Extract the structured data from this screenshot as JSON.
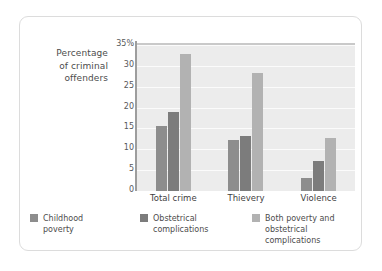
{
  "chart_data": {
    "type": "bar",
    "title": "",
    "subtitle": "",
    "xlabel": "",
    "ylabel": "Percentage of criminal offenders",
    "ylabel_lines": [
      "Percentage",
      "of criminal",
      "offenders"
    ],
    "categories": [
      "Total crime",
      "Thievery",
      "Violence"
    ],
    "series": [
      {
        "name": "Childhood poverty",
        "name_lines": [
          "Childhood",
          "poverty"
        ],
        "color": "#8d8d8d",
        "values": [
          15.5,
          12.2,
          3.2
        ]
      },
      {
        "name": "Obstetrical complications",
        "name_lines": [
          "Obstetrical",
          "complications"
        ],
        "color": "#7c7c7c",
        "values": [
          19.0,
          13.2,
          7.3
        ]
      },
      {
        "name": "Both poverty and obstetrical complications",
        "name_lines": [
          "Both poverty and",
          "obstetrical complications"
        ],
        "color": "#b2b2b2",
        "values": [
          32.8,
          28.3,
          12.7
        ]
      }
    ],
    "ylim": [
      0,
      35
    ],
    "yticks": [
      0,
      5,
      10,
      15,
      20,
      25,
      30,
      35
    ],
    "ytick_labels": [
      "0",
      "5",
      "10",
      "15",
      "20",
      "25",
      "30",
      "35%"
    ],
    "grid": true,
    "legend_position": "bottom",
    "plot_background": "#ececec",
    "gridline_color": "#fbfbfb",
    "axis_color": "#9d9d9d"
  }
}
